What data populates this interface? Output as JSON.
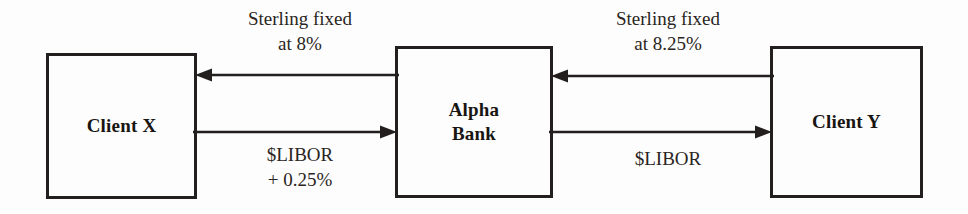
{
  "diagram": {
    "colors": {
      "background": "#fdfdfd",
      "box_border": "#231f1e",
      "arrow": "#231f1e",
      "box_text": "#191513",
      "label_text": "#2a2522"
    },
    "entities": [
      {
        "id": "client-x",
        "label": "Client X"
      },
      {
        "id": "alpha-bank",
        "label": "Alpha\nBank"
      },
      {
        "id": "client-y",
        "label": "Client Y"
      }
    ],
    "flows": [
      {
        "id": "sterling-8",
        "label": "Sterling fixed\nat 8%",
        "from": "alpha-bank",
        "to": "client-x",
        "direction": "left"
      },
      {
        "id": "libor-025",
        "label": "$LIBOR\n+ 0.25%",
        "from": "client-x",
        "to": "alpha-bank",
        "direction": "right"
      },
      {
        "id": "sterling-825",
        "label": "Sterling fixed\nat 8.25%",
        "from": "client-y",
        "to": "alpha-bank",
        "direction": "left"
      },
      {
        "id": "libor-y",
        "label": "$LIBOR",
        "from": "alpha-bank",
        "to": "client-y",
        "direction": "right"
      }
    ]
  }
}
